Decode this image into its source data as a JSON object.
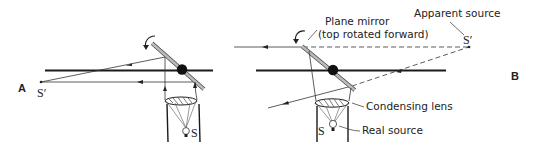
{
  "figure": {
    "panels": [
      {
        "id": "A",
        "label": "A",
        "labels": {
          "apparent_source": "S′",
          "real_source": "S"
        }
      },
      {
        "id": "B",
        "label": "B",
        "labels": {
          "apparent_source_caption": "Apparent source",
          "apparent_source": "S′",
          "mirror_caption_line1": "Plane mirror",
          "mirror_caption_line2": "(top rotated forward)",
          "lens_caption": "Condensing lens",
          "real_source_caption": "Real source",
          "real_source": "S"
        }
      }
    ],
    "colors": {
      "line": "#1a1a1a",
      "ray": "#333333",
      "mirror": "#555555"
    }
  }
}
